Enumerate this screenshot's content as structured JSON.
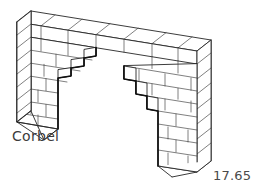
{
  "figure": {
    "title": "Corbel",
    "caption": "Corbel",
    "figure_number": "17.65",
    "background_color": "#ffffff",
    "line_color": "#262626",
    "emphasis_line_color": "#111111",
    "text_color": "#3c3c3c",
    "width_px": 261,
    "height_px": 191
  },
  "structure": {
    "type": "masonry-wall-with-corbelled-opening",
    "parts": [
      {
        "name": "left-pier",
        "label": "left pier"
      },
      {
        "name": "right-pier",
        "label": "right pier"
      },
      {
        "name": "top-wall-course",
        "label": "continuous top courses spanning the opening"
      },
      {
        "name": "left-corbel-steps",
        "label": "corbelled courses stepping out from left pier"
      },
      {
        "name": "right-corbel-steps",
        "label": "corbelled courses stepping out from right pier"
      }
    ],
    "course_count_left_pier": 7,
    "course_count_right_pier": 8,
    "corbel_step_count_left": 4,
    "corbel_step_count_right": 4
  },
  "icons": {
    "corbel_label_icon": "text-label",
    "figure_number_icon": "text-label"
  }
}
